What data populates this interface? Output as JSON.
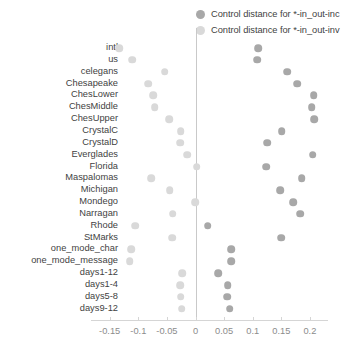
{
  "legend": {
    "position": "top-right",
    "entries": [
      {
        "label": "Control distance for *-in_out-inc",
        "color": "#a8a8a8",
        "dot": "legend-dot-dark"
      },
      {
        "label": "Control distance for *-in_out-inv",
        "color": "#d9d9d9",
        "dot": "legend-dot-light"
      }
    ]
  },
  "axis": {
    "x_ticks": [
      "-0.15",
      "-0.1",
      "-0.05",
      "0",
      "0.05",
      "0.1",
      "0.15",
      "0.2"
    ],
    "x_tick_values": [
      -0.15,
      -0.1,
      -0.05,
      0,
      0.05,
      0.1,
      0.15,
      0.2
    ],
    "xlim": [
      -0.175,
      0.225
    ],
    "zero_reference": "0"
  },
  "chart_data": {
    "type": "scatter",
    "title": "",
    "xlabel": "",
    "ylabel": "",
    "xlim": [
      -0.175,
      0.225
    ],
    "grid": false,
    "legend_position": "top-right",
    "categories": [
      "intl",
      "us",
      "celegans",
      "Chesapeake",
      "ChesLower",
      "ChesMiddle",
      "ChesUpper",
      "CrystalC",
      "CrystalD",
      "Everglades",
      "Florida",
      "Maspalomas",
      "Michigan",
      "Mondego",
      "Narragan",
      "Rhode",
      "StMarks",
      "one_mode_char",
      "one_mode_message",
      "days1-12",
      "days1-4",
      "days5-8",
      "days9-12"
    ],
    "series": [
      {
        "name": "Control distance for *-in_out-inc",
        "color": "#a8a8a8",
        "values": [
          0.11,
          0.108,
          0.16,
          0.178,
          0.207,
          0.203,
          0.208,
          0.151,
          0.125,
          0.205,
          0.124,
          0.186,
          0.148,
          0.171,
          0.183,
          0.021,
          0.15,
          0.062,
          0.062,
          0.04,
          0.056,
          0.055,
          0.06
        ]
      },
      {
        "name": "Control distance for *-in_out-inv",
        "color": "#d9d9d9",
        "values": [
          -0.133,
          -0.111,
          -0.054,
          -0.083,
          -0.074,
          -0.071,
          -0.046,
          -0.026,
          -0.027,
          -0.015,
          0.002,
          -0.077,
          -0.045,
          -0.001,
          -0.04,
          -0.105,
          -0.041,
          -0.112,
          -0.115,
          -0.023,
          -0.027,
          -0.026,
          -0.024
        ]
      }
    ]
  }
}
